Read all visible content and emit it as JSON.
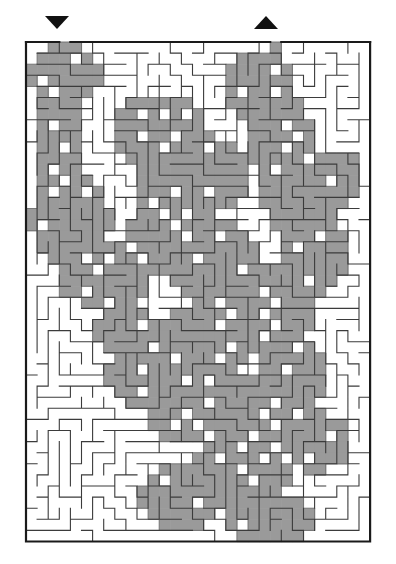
{
  "figure": {
    "name": "maze-puzzle",
    "kind": "maze",
    "width": 396,
    "height": 564,
    "background_color": "#ffffff"
  },
  "maze": {
    "origin_x": 26,
    "origin_y": 42,
    "cols": 31,
    "rows": 45,
    "cell_size": 11.1,
    "wall_color": "#3b3b3b",
    "wall_thickness": 1.1,
    "border_color": "#1a1a1a",
    "border_thickness": 2.2,
    "path_fill_color": "#9a9a9a",
    "path_outline_color": "#6e6e6e",
    "passage_color": "#ffffff",
    "seed": 20240517
  },
  "markers": {
    "entrance": {
      "label": "entrance-marker",
      "glyph": "▼",
      "direction": "down",
      "x": 57,
      "y": 22,
      "size": 12,
      "color": "#111111",
      "column": 3
    },
    "exit": {
      "label": "exit-marker",
      "glyph": "▲",
      "direction": "up",
      "x": 266,
      "y": 22,
      "size": 12,
      "color": "#111111",
      "column": 22
    }
  },
  "solution": {
    "described_as": "shaded-region",
    "fill_color": "#9a9a9a",
    "start_cell": [
      3,
      0
    ],
    "end_cell": [
      22,
      0
    ],
    "blob_seeds": [
      {
        "cx": 3.5,
        "cy": 3.0,
        "rx": 3.2,
        "ry": 3.0,
        "w": 1.0
      },
      {
        "cx": 3.0,
        "cy": 9.0,
        "rx": 2.2,
        "ry": 5.0,
        "w": 1.0
      },
      {
        "cx": 4.0,
        "cy": 16.0,
        "rx": 3.6,
        "ry": 4.4,
        "w": 1.0
      },
      {
        "cx": 7.0,
        "cy": 21.0,
        "rx": 4.0,
        "ry": 3.2,
        "w": 1.0
      },
      {
        "cx": 12.0,
        "cy": 8.0,
        "rx": 4.4,
        "ry": 3.4,
        "w": 1.0
      },
      {
        "cx": 15.0,
        "cy": 12.0,
        "rx": 5.2,
        "ry": 3.8,
        "w": 1.0
      },
      {
        "cx": 13.0,
        "cy": 17.0,
        "rx": 3.6,
        "ry": 4.0,
        "w": 1.0
      },
      {
        "cx": 17.0,
        "cy": 20.0,
        "rx": 4.2,
        "ry": 4.2,
        "w": 1.0
      },
      {
        "cx": 21.0,
        "cy": 4.0,
        "rx": 3.4,
        "ry": 3.4,
        "w": 1.0
      },
      {
        "cx": 23.0,
        "cy": 9.0,
        "rx": 3.0,
        "ry": 4.2,
        "w": 1.0
      },
      {
        "cx": 25.0,
        "cy": 14.0,
        "rx": 3.8,
        "ry": 3.6,
        "w": 1.0
      },
      {
        "cx": 26.0,
        "cy": 19.0,
        "rx": 3.2,
        "ry": 3.6,
        "w": 1.0
      },
      {
        "cx": 22.0,
        "cy": 24.0,
        "rx": 4.2,
        "ry": 3.6,
        "w": 1.0
      },
      {
        "cx": 16.0,
        "cy": 27.0,
        "rx": 4.6,
        "ry": 3.4,
        "w": 1.0
      },
      {
        "cx": 11.0,
        "cy": 30.0,
        "rx": 3.6,
        "ry": 3.4,
        "w": 1.0
      },
      {
        "cx": 15.0,
        "cy": 33.0,
        "rx": 4.0,
        "ry": 3.4,
        "w": 1.0
      },
      {
        "cx": 20.0,
        "cy": 34.0,
        "rx": 4.4,
        "ry": 4.2,
        "w": 1.0
      },
      {
        "cx": 24.0,
        "cy": 30.0,
        "rx": 3.4,
        "ry": 3.4,
        "w": 1.0
      },
      {
        "cx": 26.0,
        "cy": 36.0,
        "rx": 3.2,
        "ry": 2.8,
        "w": 1.0
      },
      {
        "cx": 19.0,
        "cy": 39.0,
        "rx": 5.0,
        "ry": 3.0,
        "w": 1.0
      },
      {
        "cx": 14.0,
        "cy": 41.0,
        "rx": 4.0,
        "ry": 3.0,
        "w": 1.0
      },
      {
        "cx": 22.0,
        "cy": 43.0,
        "rx": 4.0,
        "ry": 2.4,
        "w": 1.0
      },
      {
        "cx": 9.0,
        "cy": 26.0,
        "rx": 2.6,
        "ry": 2.6,
        "w": 1.0
      },
      {
        "cx": 28.0,
        "cy": 12.0,
        "rx": 2.4,
        "ry": 2.4,
        "w": 1.0
      }
    ]
  }
}
